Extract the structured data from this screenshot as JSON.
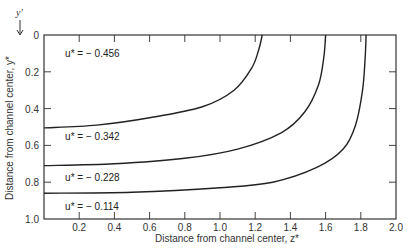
{
  "chart_data": {
    "type": "line",
    "title": "",
    "xlabel": "Distance from channel center, z*",
    "ylabel": "Distance from channel center, y*",
    "y_axis_arrow_label": "y'",
    "xlim": [
      0,
      2.0
    ],
    "ylim": [
      0,
      1.0
    ],
    "y_inverted": true,
    "grid": false,
    "x_ticks": [
      0.2,
      0.4,
      0.6,
      0.8,
      1.0,
      1.2,
      1.4,
      1.6,
      1.8,
      2.0
    ],
    "x_tick_labels": [
      "0.2",
      "0.4",
      "0.6",
      "0.8",
      "1.0",
      "1.2",
      "1.4",
      "1.6",
      "1.8",
      "2.0"
    ],
    "y_ticks": [
      0,
      0.2,
      0.4,
      0.6,
      0.8,
      1.0
    ],
    "y_tick_labels": [
      "0",
      "0.2",
      "0.4",
      "0.6",
      "0.8",
      "1.0"
    ],
    "series": [
      {
        "name": "u* = − 0.456",
        "label_text": "u* = − 0.456",
        "points": [
          [
            0.0,
            0.505
          ],
          [
            0.3,
            0.49
          ],
          [
            0.6,
            0.45
          ],
          [
            0.9,
            0.39
          ],
          [
            1.08,
            0.3
          ],
          [
            1.18,
            0.18
          ],
          [
            1.22,
            0.08
          ],
          [
            1.24,
            0.0
          ]
        ]
      },
      {
        "name": "u* = − 0.342",
        "label_text": "u* = − 0.342",
        "points": [
          [
            0.0,
            0.71
          ],
          [
            0.4,
            0.7
          ],
          [
            0.8,
            0.67
          ],
          [
            1.1,
            0.62
          ],
          [
            1.35,
            0.53
          ],
          [
            1.48,
            0.42
          ],
          [
            1.56,
            0.27
          ],
          [
            1.59,
            0.12
          ],
          [
            1.6,
            0.0
          ]
        ]
      },
      {
        "name": "u* = − 0.228",
        "label_text": "u* = − 0.228",
        "points": [
          [
            0.0,
            0.86
          ],
          [
            0.5,
            0.855
          ],
          [
            1.0,
            0.83
          ],
          [
            1.3,
            0.8
          ],
          [
            1.55,
            0.72
          ],
          [
            1.7,
            0.62
          ],
          [
            1.77,
            0.49
          ],
          [
            1.81,
            0.3
          ],
          [
            1.825,
            0.12
          ],
          [
            1.83,
            0.0
          ]
        ]
      },
      {
        "name": "u* = − 0.114",
        "label_text": "u* = − 0.114",
        "points": []
      }
    ],
    "label_positions": [
      {
        "text": "u* = − 0.456",
        "x": 0.12,
        "y": 0.1
      },
      {
        "text": "u* = − 0.342",
        "x": 0.12,
        "y": 0.55
      },
      {
        "text": "u* = − 0.228",
        "x": 0.12,
        "y": 0.77
      },
      {
        "text": "u* = − 0.114",
        "x": 0.12,
        "y": 0.93
      }
    ]
  }
}
